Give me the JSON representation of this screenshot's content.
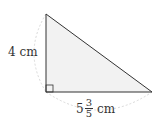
{
  "figure": {
    "type": "right-triangle",
    "colors": {
      "fill": "#f2f2f2",
      "stroke": "#333333",
      "dimension_arc": "#d9d9d9"
    },
    "vertices": {
      "top": [
        46,
        14
      ],
      "right_angle": [
        46,
        92
      ],
      "right": [
        152,
        92
      ]
    },
    "right_angle_marker": true
  },
  "labels": {
    "vertical_side": "4 cm",
    "horizontal_side": {
      "whole": "5",
      "numerator": "3",
      "denominator": "5",
      "unit": "cm"
    }
  }
}
